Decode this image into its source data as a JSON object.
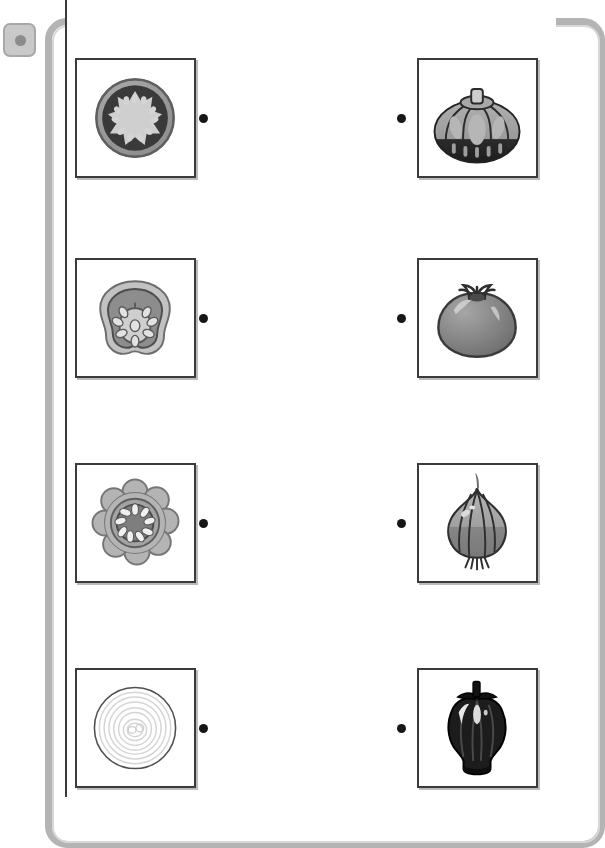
{
  "page": {
    "background_color": "#ffffff",
    "frame_color": "#b4b4b4",
    "card_border_color": "#3b3b3b",
    "connector_color": "#161616"
  },
  "toolbar": {
    "button_label": "",
    "button_icon": "circle-dot-icon"
  },
  "instructions": "",
  "matching_rows": [
    {
      "index": 1,
      "left": {
        "label": "Tomato cross-section",
        "icon": "tomato-cross-section-icon"
      },
      "right": {
        "label": "Pumpkin",
        "icon": "pumpkin-icon"
      },
      "connector_left": "•",
      "connector_right": "•"
    },
    {
      "index": 2,
      "left": {
        "label": "Bell pepper cross-section",
        "icon": "pepper-cross-section-icon"
      },
      "right": {
        "label": "Tomato",
        "icon": "tomato-icon"
      },
      "connector_left": "•",
      "connector_right": "•"
    },
    {
      "index": 3,
      "left": {
        "label": "Pumpkin cross-section",
        "icon": "pumpkin-cross-section-icon"
      },
      "right": {
        "label": "Onion",
        "icon": "onion-icon"
      },
      "connector_left": "•",
      "connector_right": "•"
    },
    {
      "index": 4,
      "left": {
        "label": "Onion cross-section",
        "icon": "onion-cross-section-icon"
      },
      "right": {
        "label": "Bell pepper",
        "icon": "bell-pepper-icon"
      },
      "connector_left": "•",
      "connector_right": "•"
    }
  ]
}
